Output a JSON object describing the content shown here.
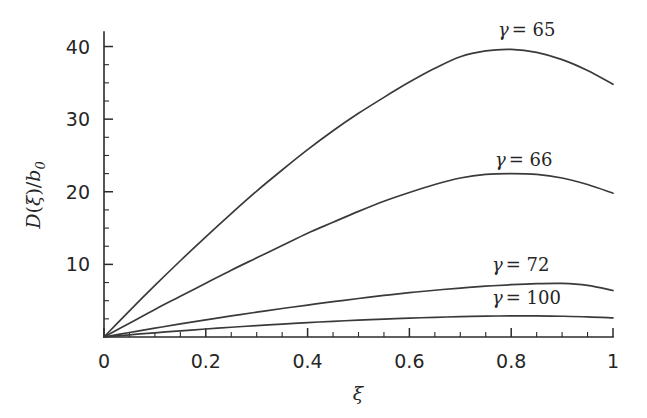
{
  "figure": {
    "background_color": "#ffffff",
    "axis_color": "#2b2b2b",
    "curve_color": "#3a3a3a",
    "text_color": "#262626"
  },
  "chart_data": {
    "type": "line",
    "title": "",
    "xlabel": "ξ",
    "ylabel": "D(ξ)/b₀",
    "xlim": [
      0,
      1
    ],
    "ylim": [
      0,
      42
    ],
    "grid": false,
    "legend_position": "inline-annotations",
    "x_ticks": [
      {
        "value": 0,
        "label": "0"
      },
      {
        "value": 0.2,
        "label": "0.2"
      },
      {
        "value": 0.4,
        "label": "0.4"
      },
      {
        "value": 0.6,
        "label": "0.6"
      },
      {
        "value": 0.8,
        "label": "0.8"
      },
      {
        "value": 1,
        "label": "1"
      }
    ],
    "x_minor_step": 0.05,
    "y_ticks": [
      {
        "value": 10,
        "label": "10"
      },
      {
        "value": 20,
        "label": "20"
      },
      {
        "value": 30,
        "label": "30"
      },
      {
        "value": 40,
        "label": "40"
      }
    ],
    "y_minor_step": 2.5,
    "x": [
      0,
      0.05,
      0.1,
      0.15,
      0.2,
      0.25,
      0.3,
      0.35,
      0.4,
      0.45,
      0.5,
      0.55,
      0.6,
      0.65,
      0.7,
      0.75,
      0.8,
      0.85,
      0.9,
      0.95,
      1
    ],
    "series": [
      {
        "name": "γ = 65",
        "gamma": 65,
        "label_text": "= 65",
        "peak": {
          "x": 0.7,
          "y": 39.7
        },
        "end_value": 34.8,
        "values": [
          0,
          3.6,
          7.1,
          10.5,
          13.8,
          17.0,
          20.1,
          23.0,
          25.8,
          28.4,
          30.8,
          33.0,
          35.1,
          37.0,
          38.6,
          39.4,
          39.6,
          39.2,
          38.2,
          36.7,
          34.8
        ]
      },
      {
        "name": "γ = 66",
        "gamma": 66,
        "label_text": "= 66",
        "peak": {
          "x": 0.7,
          "y": 22.5
        },
        "end_value": 19.8,
        "values": [
          0,
          1.9,
          3.8,
          5.6,
          7.4,
          9.2,
          10.9,
          12.6,
          14.3,
          15.8,
          17.3,
          18.7,
          19.9,
          21.0,
          21.9,
          22.4,
          22.5,
          22.4,
          21.9,
          21.0,
          19.8
        ]
      },
      {
        "name": "γ = 72",
        "gamma": 72,
        "label_text": "= 72",
        "peak": {
          "x": 0.72,
          "y": 7.4
        },
        "end_value": 6.4,
        "values": [
          0,
          0.62,
          1.22,
          1.8,
          2.36,
          2.9,
          3.42,
          3.92,
          4.4,
          4.86,
          5.3,
          5.72,
          6.1,
          6.44,
          6.74,
          7.0,
          7.2,
          7.34,
          7.38,
          7.1,
          6.4
        ]
      },
      {
        "name": "γ = 100",
        "gamma": 100,
        "label_text": "= 100",
        "peak": {
          "x": 0.75,
          "y": 2.9
        },
        "end_value": 2.62,
        "values": [
          0,
          0.3,
          0.58,
          0.85,
          1.1,
          1.34,
          1.57,
          1.78,
          1.98,
          2.16,
          2.32,
          2.47,
          2.6,
          2.71,
          2.8,
          2.87,
          2.9,
          2.9,
          2.86,
          2.78,
          2.62
        ]
      }
    ],
    "annotations": [
      {
        "series": "γ = 65",
        "gamma_symbol": "γ",
        "text": "= 65",
        "x_px": 498,
        "y_px": 36
      },
      {
        "series": "γ = 66",
        "gamma_symbol": "γ",
        "text": "= 66",
        "x_px": 495,
        "y_px": 166
      },
      {
        "series": "γ = 72",
        "gamma_symbol": "γ",
        "text": "= 72",
        "x_px": 492,
        "y_px": 271
      },
      {
        "series": "γ = 100",
        "gamma_symbol": "γ",
        "text": "= 100",
        "x_px": 492,
        "y_px": 304
      }
    ]
  },
  "axis_titles": {
    "y_main": "D",
    "y_paren_open": "(",
    "y_xi": "ξ",
    "y_paren_close": ")/",
    "y_b": "b",
    "y_sub": "0",
    "x_symbol": "ξ"
  }
}
